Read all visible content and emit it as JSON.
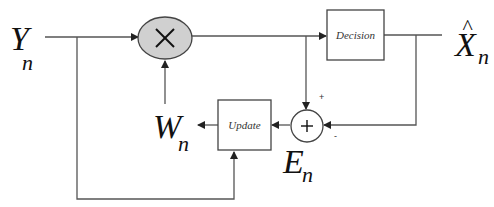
{
  "diagram": {
    "type": "block-diagram",
    "colors": {
      "line": "#555555",
      "multiplier_fill": "#d0d0d0",
      "text": "#111111"
    },
    "signals": {
      "input": {
        "base": "Y",
        "sub": "n"
      },
      "output": {
        "base": "X",
        "hat": "^",
        "sub": "n"
      },
      "weight": {
        "base": "W",
        "sub": "n"
      },
      "error": {
        "base": "E",
        "sub": "n"
      }
    },
    "blocks": {
      "multiplier": {
        "symbol": "×"
      },
      "decision": {
        "label": "Decision"
      },
      "update": {
        "label": "Update"
      },
      "summer": {
        "symbol": "+",
        "plus_sign": "+",
        "minus_sign": "-"
      }
    },
    "connections": [
      {
        "from": "Y_n",
        "to": "multiplier"
      },
      {
        "from": "Y_n",
        "to": "update"
      },
      {
        "from": "W_n",
        "to": "multiplier"
      },
      {
        "from": "multiplier",
        "to": "decision"
      },
      {
        "from": "multiplier",
        "to": "summer",
        "sign": "+"
      },
      {
        "from": "decision",
        "to": "X̂_n"
      },
      {
        "from": "decision",
        "to": "summer",
        "sign": "-"
      },
      {
        "from": "summer",
        "to": "update"
      },
      {
        "from": "update",
        "to": "W_n"
      }
    ]
  }
}
